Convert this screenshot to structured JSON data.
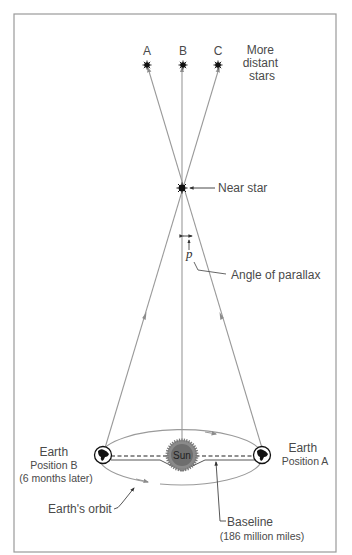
{
  "diagram": {
    "distant_stars": {
      "labels": [
        "A",
        "B",
        "C"
      ],
      "caption_lines": [
        "More",
        "distant",
        "stars"
      ]
    },
    "near_star": {
      "label": "Near star"
    },
    "parallax": {
      "symbol": "p",
      "label": "Angle of parallax"
    },
    "sun": {
      "label": "Sun"
    },
    "earth_b": {
      "lines": [
        "Earth",
        "Position B",
        "(6 months later)"
      ]
    },
    "earth_a": {
      "lines": [
        "Earth",
        "Position A"
      ]
    },
    "orbit": {
      "label": "Earth's orbit"
    },
    "baseline": {
      "label": "Baseline",
      "distance": "(186 million miles)"
    },
    "colors": {
      "frame": "#9a9a9a",
      "line": "#8c8c8c",
      "text": "#4a4a4a",
      "star": "#111111",
      "sun": "#6a6a6a"
    }
  }
}
